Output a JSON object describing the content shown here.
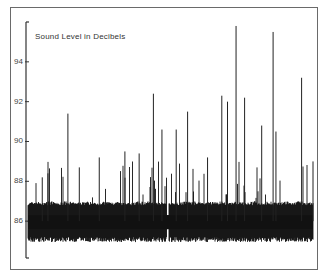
{
  "chart_data": {
    "type": "line",
    "title": "Sound Level in Decibels",
    "xlabel": "",
    "ylabel": "",
    "ylim": [
      84.15,
      96
    ],
    "yticks": [
      86,
      88,
      90,
      92,
      94
    ],
    "grid": false,
    "baseline_range_db": [
      85.2,
      86.8
    ],
    "typical_peak_db": [
      87,
      89
    ],
    "spikes": [
      {
        "x_frac": 0.05,
        "db": 88.2
      },
      {
        "x_frac": 0.07,
        "db": 88.4
      },
      {
        "x_frac": 0.14,
        "db": 91.4
      },
      {
        "x_frac": 0.18,
        "db": 88.7
      },
      {
        "x_frac": 0.25,
        "db": 89.2
      },
      {
        "x_frac": 0.34,
        "db": 89.5
      },
      {
        "x_frac": 0.39,
        "db": 89.4
      },
      {
        "x_frac": 0.44,
        "db": 92.4
      },
      {
        "x_frac": 0.47,
        "db": 90.6
      },
      {
        "x_frac": 0.52,
        "db": 90.6
      },
      {
        "x_frac": 0.56,
        "db": 91.5
      },
      {
        "x_frac": 0.63,
        "db": 89.2
      },
      {
        "x_frac": 0.68,
        "db": 92.3
      },
      {
        "x_frac": 0.7,
        "db": 92.0
      },
      {
        "x_frac": 0.73,
        "db": 95.8
      },
      {
        "x_frac": 0.76,
        "db": 92.2
      },
      {
        "x_frac": 0.82,
        "db": 90.8
      },
      {
        "x_frac": 0.86,
        "db": 95.5
      },
      {
        "x_frac": 0.87,
        "db": 90.5
      },
      {
        "x_frac": 0.96,
        "db": 93.2
      },
      {
        "x_frac": 1.0,
        "db": 89.0
      }
    ]
  }
}
